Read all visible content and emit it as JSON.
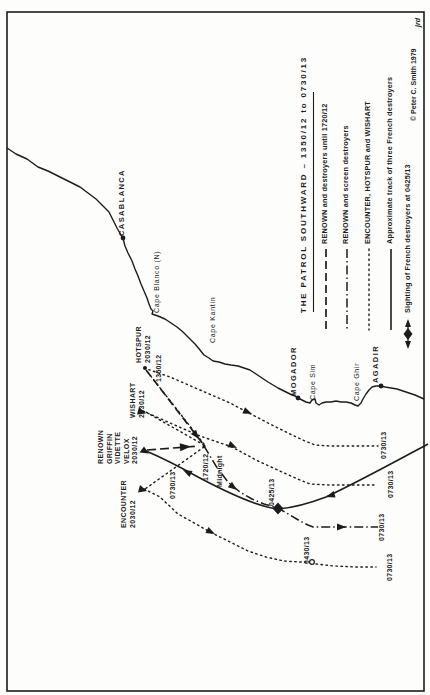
{
  "map": {
    "places": {
      "casablanca": "CASABLANCA",
      "cape_blanco": "Cape Blanco (N)",
      "cape_kantin": "Cape Kantin",
      "mogador": "MOGADOR",
      "cape_sim": "Cape Sim",
      "cape_ghir": "Cape Ghir",
      "agadir": "AGADIR"
    },
    "ships": {
      "hotspur": {
        "name": "HOTSPUR",
        "time": "2030/12"
      },
      "wishart": {
        "name": "WISHART",
        "time": "2030/12"
      },
      "renown_group": {
        "line1": "RENOWN",
        "line2": "GRIFFIN",
        "line3": "VIDETTE",
        "line4": "VELOX",
        "time": "2030/12"
      },
      "encounter": {
        "name": "ENCOUNTER",
        "time": "2030/12"
      }
    },
    "times": {
      "start": "1350/12",
      "turn": "1720/12",
      "midnight": "Midnight",
      "sighting": "0425/13",
      "renown_turn": "0430/13",
      "end_french": "0730/13",
      "end_hotspur": "0730/13",
      "end_wishart": "0730/13",
      "end_renown": "0730/13",
      "end_encounter": "0730/13"
    },
    "ink_color": "#1c1c1c",
    "paper_color": "#fdfdfb"
  },
  "legend": {
    "title": "THE PATROL SOUTHWARD – 1350/12 to 0730/13",
    "entries": [
      {
        "style": "long-dash",
        "label": "RENOWN and destroyers until 1720/12"
      },
      {
        "style": "dash-dot",
        "label": "RENOWN and screen destroyers"
      },
      {
        "style": "dotted",
        "label": "ENCOUNTER, HOTSPUR and WISHART"
      },
      {
        "style": "solid",
        "label": "Approximate track of three French destroyers"
      }
    ],
    "sighting": "Sighting of French destroyers at 0425/13",
    "credit": "© Peter C. Smith 1979",
    "initials": "jrd"
  }
}
